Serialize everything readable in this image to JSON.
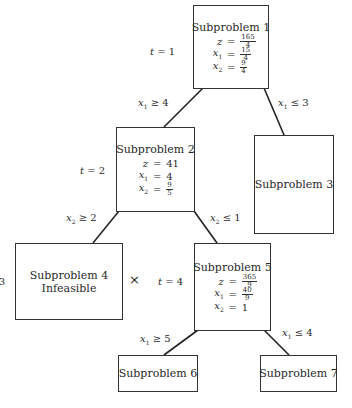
{
  "diagram": {
    "type": "branch-and-bound-tree",
    "nodes": [
      {
        "id": "sp1",
        "title": "Subproblem 1",
        "z": {
          "num": "165",
          "den": "4"
        },
        "x1": {
          "num": "15",
          "den": "4"
        },
        "x2": {
          "num": "9",
          "den": "4"
        },
        "t": "1"
      },
      {
        "id": "sp2",
        "title": "Subproblem 2",
        "z": "41",
        "x1": "4",
        "x2": {
          "num": "9",
          "den": "5"
        },
        "t": "2"
      },
      {
        "id": "sp3",
        "title": "Subproblem 3"
      },
      {
        "id": "sp4",
        "title": "Subproblem 4",
        "status": "Infeasible",
        "t": "3",
        "mark": "×"
      },
      {
        "id": "sp5",
        "title": "Subproblem 5",
        "z": {
          "num": "365",
          "den": "9"
        },
        "x1": {
          "num": "40",
          "den": "9"
        },
        "x2": "1",
        "t": "4"
      },
      {
        "id": "sp6",
        "title": "Subproblem 6"
      },
      {
        "id": "sp7",
        "title": "Subproblem 7"
      }
    ],
    "edges": [
      {
        "from": "sp1",
        "to": "sp2",
        "var": "x",
        "sub": "1",
        "op": "≥",
        "rhs": "4"
      },
      {
        "from": "sp1",
        "to": "sp3",
        "var": "x",
        "sub": "1",
        "op": "≤",
        "rhs": "3"
      },
      {
        "from": "sp2",
        "to": "sp4",
        "var": "x",
        "sub": "2",
        "op": "≥",
        "rhs": "2"
      },
      {
        "from": "sp2",
        "to": "sp5",
        "var": "x",
        "sub": "2",
        "op": "≤",
        "rhs": "1"
      },
      {
        "from": "sp5",
        "to": "sp6",
        "var": "x",
        "sub": "1",
        "op": "≥",
        "rhs": "5"
      },
      {
        "from": "sp5",
        "to": "sp7",
        "var": "x",
        "sub": "1",
        "op": "≤",
        "rhs": "4"
      }
    ],
    "t_label": "t",
    "eq_sign": "=",
    "var_names": {
      "z": "z",
      "x": "x",
      "x1_sub": "1",
      "x2_sub": "2"
    }
  }
}
